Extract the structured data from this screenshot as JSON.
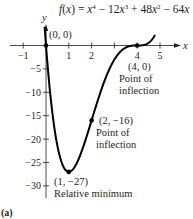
{
  "chart_data": {
    "type": "line",
    "title_parts": {
      "f": "f",
      "x": "x",
      "open": "(",
      "close": ")",
      "eq": " = ",
      "t1": "x",
      "e1": "4",
      "m1": " − 12",
      "t2": "x",
      "e2": "3",
      "p1": " + 48",
      "t3": "x",
      "e3": "2",
      "m2": " − 64",
      "t4": "x"
    },
    "xlabel": "x",
    "ylabel": "y",
    "xlim": [
      -1.3,
      5.8
    ],
    "ylim": [
      -33,
      4
    ],
    "x_ticks": [
      -1,
      1,
      2,
      3,
      4,
      5
    ],
    "x_tick_labels": [
      "−1",
      "1",
      "2",
      "",
      "4",
      "5"
    ],
    "y_ticks": [
      -5,
      -10,
      -15,
      -20,
      -25,
      -30
    ],
    "y_tick_labels": [
      "−5",
      "−10",
      "−15",
      "−20",
      "−25",
      "−30"
    ],
    "grid": false,
    "series": [
      {
        "name": "f(x)",
        "x": [
          -0.06,
          0,
          0.25,
          0.5,
          0.75,
          1,
          1.25,
          1.5,
          1.75,
          2,
          2.25,
          2.5,
          2.75,
          3,
          3.25,
          3.5,
          3.75,
          4,
          4.25,
          4.5,
          4.78
        ],
        "y": [
          3.7,
          0,
          -11.4,
          -21.4,
          -25.7,
          -27,
          -25.8,
          -23.4,
          -19.9,
          -16,
          -12.1,
          -8.4,
          -5.4,
          -3,
          -1.4,
          -0.4,
          -0.06,
          0,
          0.07,
          0.56,
          2.27
        ]
      }
    ],
    "points": [
      {
        "x": 0,
        "y": 0,
        "label": "(0, 0)"
      },
      {
        "x": 1,
        "y": -27,
        "label": "(1, −27)",
        "note": "Relative minimum"
      },
      {
        "x": 2,
        "y": -16,
        "label": "(2, −16)",
        "note_line1": "Point of",
        "note_line2": "inflection"
      },
      {
        "x": 4,
        "y": 0,
        "label": "(4, 0)",
        "note_line1": "Point of",
        "note_line2": "inflection"
      }
    ],
    "panel_label": "(a)"
  }
}
